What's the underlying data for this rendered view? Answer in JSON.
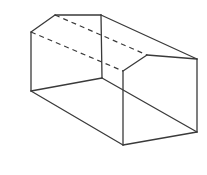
{
  "diagram": {
    "type": "wireframe-solid",
    "stroke_color": "#3a3a3a",
    "background": "#ffffff",
    "vertices": {
      "back_peak_left": [
        55,
        15
      ],
      "back_top_right": [
        101,
        15
      ],
      "back_mid_left": [
        31,
        32
      ],
      "back_bottom_left": [
        31,
        91
      ],
      "back_bottom_right": [
        102,
        78
      ],
      "front_top_left": [
        123,
        71
      ],
      "front_peak": [
        147,
        55
      ],
      "front_top_right": [
        197,
        59
      ],
      "front_bottom_right": [
        197,
        132
      ],
      "front_bottom_left": [
        123,
        145
      ]
    },
    "solid_edges": [
      [
        "back_mid_left",
        "back_peak_left"
      ],
      [
        "back_peak_left",
        "back_top_right"
      ],
      [
        "back_mid_left",
        "back_bottom_left"
      ],
      [
        "back_bottom_left",
        "back_bottom_right"
      ],
      [
        "back_top_right",
        "back_bottom_right"
      ],
      [
        "back_top_right",
        "front_top_right"
      ],
      [
        "back_bottom_right",
        "front_bottom_right"
      ],
      [
        "back_bottom_left",
        "front_bottom_left"
      ],
      [
        "front_top_left",
        "front_peak"
      ],
      [
        "front_peak",
        "front_top_right"
      ],
      [
        "front_top_left",
        "front_bottom_left"
      ],
      [
        "front_top_right",
        "front_bottom_right"
      ],
      [
        "front_bottom_left",
        "front_bottom_right"
      ]
    ],
    "dashed_edges": [
      [
        "back_peak_left",
        "front_peak"
      ],
      [
        "back_mid_left",
        "front_top_left"
      ]
    ]
  }
}
